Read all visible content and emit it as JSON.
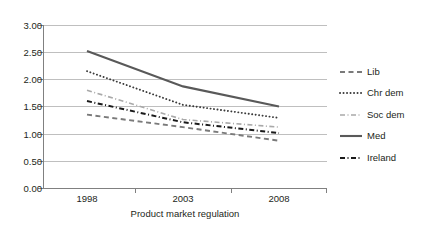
{
  "chart_data": {
    "type": "line",
    "title": "",
    "xlabel": "Product market regulation",
    "ylabel": "",
    "categories": [
      "1998",
      "2003",
      "2008"
    ],
    "x": [
      1998,
      2003,
      2008
    ],
    "ylim": [
      0.0,
      3.0
    ],
    "ytick_step": 0.5,
    "ytick_labels": [
      "0.00",
      "0.50",
      "1.00",
      "1.50",
      "2.00",
      "2.50",
      "3.00"
    ],
    "ytick_values": [
      0.0,
      0.5,
      1.0,
      1.5,
      2.0,
      2.5,
      3.0
    ],
    "grid": "horizontal",
    "legend_position": "right",
    "series": [
      {
        "name": "Lib",
        "values": [
          1.35,
          1.12,
          0.87
        ],
        "style": "dashed",
        "color": "#7a7a7a",
        "width": 1.9
      },
      {
        "name": "Chr dem",
        "values": [
          2.15,
          1.53,
          1.29
        ],
        "style": "dotted",
        "color": "#3a3a3a",
        "width": 1.9
      },
      {
        "name": "Soc dem",
        "values": [
          1.8,
          1.26,
          1.12
        ],
        "style": "dash-dot",
        "color": "#a9a9a9",
        "width": 1.6
      },
      {
        "name": "Med",
        "values": [
          2.52,
          1.87,
          1.5
        ],
        "style": "solid",
        "color": "#595959",
        "width": 2.1
      },
      {
        "name": "Ireland",
        "values": [
          1.6,
          1.21,
          1.01
        ],
        "style": "dash-dot",
        "color": "#1a1a1a",
        "width": 2.0
      }
    ]
  },
  "axis": {
    "x_title": "Product market regulation",
    "x_tick_labels": [
      "1998",
      "2003",
      "2008"
    ],
    "y_tick_labels": [
      "3.00",
      "2.50",
      "2.00",
      "1.50",
      "1.00",
      "0.50",
      "0.00"
    ]
  },
  "legend": {
    "items": [
      {
        "label": "Lib"
      },
      {
        "label": "Chr dem"
      },
      {
        "label": "Soc dem"
      },
      {
        "label": "Med"
      },
      {
        "label": "Ireland"
      }
    ]
  },
  "colors": {
    "grid": "#bfbfbf",
    "axis": "#808080",
    "text": "#231f20",
    "background": "#ffffff"
  }
}
